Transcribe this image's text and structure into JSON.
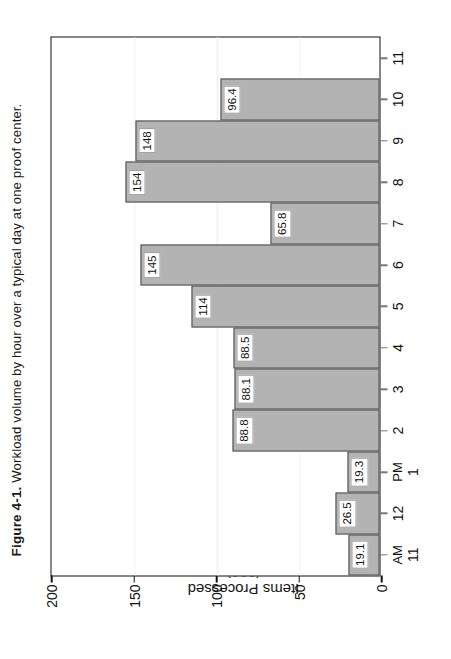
{
  "caption": {
    "number": "Figure 4-1.",
    "text": "Workload volume by hour over a typical day at one proof center."
  },
  "chart_data": {
    "type": "bar",
    "title": "",
    "xlabel": "Time (hours)",
    "ylabel": "Items Processed\n(000)",
    "ylabel_line1": "Items Processed",
    "ylabel_line2": "(000)",
    "ylim": [
      0,
      200
    ],
    "yticks": [
      0,
      50,
      100,
      150,
      200
    ],
    "ytick_labels": [
      "0",
      "50",
      "100",
      "150",
      "200"
    ],
    "grid": "horizontal-white",
    "legend": "none",
    "bar_color": "#b3b3b3",
    "bar_edge_color": "#4a4a4a",
    "label_box_color": "#ffffff",
    "categories": [
      "11",
      "12",
      "1",
      "2",
      "3",
      "4",
      "5",
      "6",
      "7",
      "8",
      "9",
      "10",
      "11"
    ],
    "category_periods": [
      "AM",
      "",
      "PM",
      "",
      "",
      "",
      "",
      "",
      "",
      "",
      "",
      "",
      ""
    ],
    "values": [
      19.1,
      26.5,
      19.3,
      88.8,
      88.1,
      88.5,
      114,
      145,
      65.8,
      154,
      148,
      96.4,
      null
    ],
    "value_labels": [
      "19.1",
      "26.5",
      "19.3",
      "88.8",
      "88.1",
      "88.5",
      "114",
      "145",
      "65.8",
      "154",
      "148",
      "96.4",
      ""
    ]
  }
}
